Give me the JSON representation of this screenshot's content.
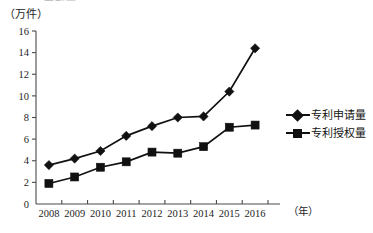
{
  "top_clipped_text": "专利量",
  "unit_label": "（万件）",
  "x_axis_unit": "（年）",
  "legend": {
    "items": [
      {
        "symbol": "diamond-marker-icon",
        "label": "专利申请量"
      },
      {
        "symbol": "square-marker-icon",
        "label": "专利授权量"
      }
    ]
  },
  "chart_data": {
    "type": "line",
    "title": "",
    "xlabel": "（年）",
    "ylabel": "（万件）",
    "categories": [
      "2008",
      "2009",
      "2010",
      "2011",
      "2012",
      "2013",
      "2014",
      "2015",
      "2016"
    ],
    "series": [
      {
        "name": "专利申请量",
        "marker": "diamond",
        "color": "#111111",
        "values": [
          3.6,
          4.2,
          4.9,
          6.3,
          7.2,
          8.0,
          8.1,
          10.4,
          14.4
        ]
      },
      {
        "name": "专利授权量",
        "marker": "square",
        "color": "#111111",
        "values": [
          1.9,
          2.5,
          3.4,
          3.9,
          4.8,
          4.7,
          5.3,
          7.1,
          7.3
        ]
      }
    ],
    "ylim": [
      0,
      16
    ],
    "yticks": [
      0,
      2,
      4,
      6,
      8,
      10,
      12,
      14,
      16
    ],
    "ytick_labels": [
      "0",
      "2",
      "4",
      "6",
      "8",
      "10",
      "12",
      "14",
      "16"
    ],
    "xtick_labels": [
      "2008",
      "2009",
      "2010",
      "2011",
      "2012",
      "2013",
      "2014",
      "2015",
      "2016"
    ],
    "grid": false,
    "legend_position": "right"
  }
}
